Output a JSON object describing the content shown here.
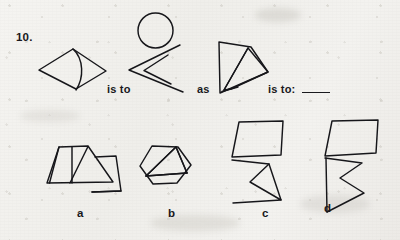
{
  "page": {
    "kind": "scanned-worksheet",
    "question_number": "10.",
    "background_color": "#f2f1ee",
    "ink_color": "#16161a"
  },
  "prompt": {
    "connector_1": "is to",
    "connector_2": "as",
    "connector_3": "is to:",
    "answer_blank": "____"
  },
  "figures": [
    {
      "id": "term-a",
      "data_name": "figure-term-a",
      "description": "rhombus with inward curved arc near left vertex",
      "position": {
        "x": 38,
        "y": 43,
        "w": 70,
        "h": 48
      }
    },
    {
      "id": "term-b",
      "data_name": "figure-term-b",
      "description": "circle above two nested leftward chevrons",
      "position": {
        "x": 126,
        "y": 12,
        "w": 78,
        "h": 82
      }
    },
    {
      "id": "term-c",
      "data_name": "figure-term-c",
      "description": "trapezoid with vertical left edge containing inner quadrilateral",
      "position": {
        "x": 217,
        "y": 38,
        "w": 52,
        "h": 56
      }
    }
  ],
  "options": [
    {
      "letter": "a",
      "data_name": "option-a",
      "description": "trapezoid divided by two vertical lines, with detached open zigzag at right"
    },
    {
      "letter": "b",
      "data_name": "option-b",
      "description": "hexagon containing an inscribed triangle"
    },
    {
      "letter": "c",
      "data_name": "option-c",
      "description": "parallelogram above an angular zigzag arrow form"
    },
    {
      "letter": "d",
      "data_name": "option-d",
      "description": "parallelogram above a bowtie-like folded zigzag form"
    }
  ],
  "colors": {
    "paper": "#f2f1ee",
    "ink": "#16161a",
    "grain": "#aaa7a0"
  }
}
